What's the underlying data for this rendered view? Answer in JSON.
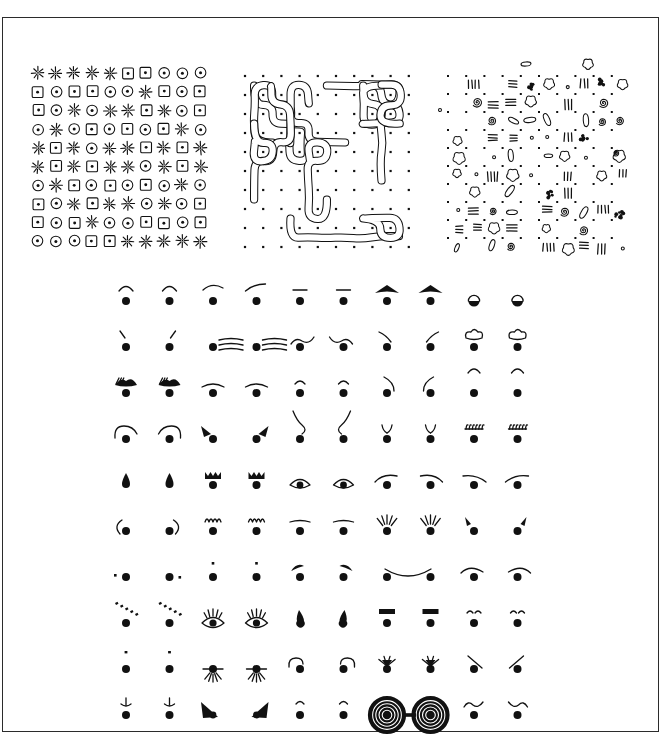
{
  "figure": {
    "title": "",
    "background_color": "#ffffff",
    "ink_color": "#111111",
    "frame": {
      "border_color": "#2b2b2b",
      "border_width_px": 1.4
    }
  },
  "top_panels": [
    {
      "name": "symbol-grid-panel",
      "description": "10 by 10 grid of three repeating hand-drawn symbols",
      "symbol_legend": {
        "S": "starburst-icon",
        "Q": "square-dot-icon",
        "C": "circle-dot-icon"
      },
      "rows": 10,
      "cols": 10,
      "cells": [
        [
          "S",
          "S",
          "S",
          "S",
          "S",
          "Q",
          "Q",
          "C",
          "C",
          "C"
        ],
        [
          "Q",
          "C",
          "Q",
          "Q",
          "C",
          "C",
          "S",
          "Q",
          "C",
          "Q"
        ],
        [
          "Q",
          "C",
          "S",
          "C",
          "S",
          "S",
          "Q",
          "S",
          "C",
          "Q"
        ],
        [
          "C",
          "S",
          "C",
          "Q",
          "C",
          "Q",
          "C",
          "Q",
          "S",
          "C"
        ],
        [
          "S",
          "Q",
          "S",
          "C",
          "S",
          "S",
          "Q",
          "S",
          "Q",
          "S"
        ],
        [
          "S",
          "Q",
          "S",
          "Q",
          "S",
          "S",
          "C",
          "S",
          "Q",
          "S"
        ],
        [
          "C",
          "S",
          "Q",
          "C",
          "Q",
          "C",
          "Q",
          "C",
          "S",
          "C"
        ],
        [
          "Q",
          "C",
          "S",
          "Q",
          "S",
          "S",
          "C",
          "S",
          "C",
          "Q"
        ],
        [
          "Q",
          "C",
          "Q",
          "S",
          "C",
          "C",
          "Q",
          "Q",
          "C",
          "Q"
        ],
        [
          "C",
          "C",
          "C",
          "Q",
          "Q",
          "S",
          "S",
          "S",
          "S",
          "S"
        ]
      ]
    },
    {
      "name": "squiggle-maze-panel",
      "description": "Continuous organic squiggle ribbons weaving around a regular dot lattice",
      "dot_rows": 10,
      "dot_cols": 10
    },
    {
      "name": "doodle-texture-panel",
      "description": "Scattered assorted hand-drawn marks on a dot lattice",
      "dot_rows": 10,
      "dot_cols": 10,
      "mark_types": [
        "cloud-blob-icon",
        "spiral-icon",
        "tally-marks-icon",
        "oval-icon",
        "scribble-blob-icon",
        "small-dot-icon"
      ]
    }
  ],
  "eye_grid": {
    "name": "eye-variations-grid",
    "description": "Ten rows by ten columns of hand-drawn eye glyphs; each glyph is a solid pupil dot with a different brow, lash or lid mark",
    "rows": 10,
    "cols": 10,
    "column_count_label": "10",
    "row_count_label": "10",
    "glyphs": [
      [
        "arc-brow-high",
        "arc-brow-high",
        "arc-brow-wide",
        "arc-brow-slant",
        "flat-bar-brow",
        "flat-bar-brow",
        "solid-triangle-brow",
        "solid-triangle-brow",
        "dome-lid",
        "dome-lid"
      ],
      [
        "short-tick-left",
        "short-tick-right",
        "triple-line-brow",
        "triple-line-brow",
        "wave-lid-left",
        "wave-lid-right",
        "angled-brow-left",
        "angled-brow-right",
        "cloud-brow",
        "cloud-brow"
      ],
      [
        "hatched-solid-brow",
        "hatched-solid-brow",
        "thin-lid-arc",
        "thin-lid-arc",
        "peak-brow-small",
        "peak-brow-small",
        "hook-brow-left",
        "hook-brow-right",
        "floating-arc",
        "floating-arc"
      ],
      [
        "curl-lid-left",
        "curl-lid-right",
        "wedge-brow-left",
        "wedge-brow-right",
        "s-curve-brow-left",
        "s-curve-brow-right",
        "antenna-brow",
        "antenna-brow",
        "comb-lash-brow",
        "comb-lash-brow"
      ],
      [
        "teardrop-pupil",
        "teardrop-pupil",
        "crown-brow",
        "crown-brow",
        "open-eye-lid",
        "open-eye-lid",
        "swoop-lid-left",
        "swoop-lid-right",
        "long-lid-left",
        "long-lid-right"
      ],
      [
        "c-lid-left",
        "c-lid-right",
        "scallop-lash-brow",
        "scallop-lash-brow",
        "flat-lid-bar",
        "flat-lid-bar",
        "ray-lash-burst",
        "ray-lash-burst",
        "tick-lash-left",
        "tick-lash-right"
      ],
      [
        "side-speck-left",
        "side-speck-right",
        "dot-above-pupil",
        "dot-above-pupil",
        "peak-lid-left",
        "peak-lid-right",
        "wide-smile-arc-left",
        "wide-smile-arc-right",
        "swoosh-lid-left",
        "swoosh-lid-right"
      ],
      [
        "dashed-slash-brow",
        "dashed-slash-brow",
        "lashed-open-eye",
        "lashed-open-eye",
        "droplet-pupil-left",
        "droplet-pupil-right",
        "block-bar-brow",
        "block-bar-brow",
        "tiny-arc-pair",
        "tiny-arc-pair"
      ],
      [
        "plain-pupil-speck",
        "plain-pupil-speck",
        "lower-lash-burst",
        "lower-lash-burst",
        "curl-over-lid-left",
        "curl-over-lid-right",
        "crow-foot-lash",
        "crow-foot-lash",
        "slash-through-left",
        "slash-through-right"
      ],
      [
        "anchor-brow",
        "anchor-brow",
        "solid-wedge-left",
        "solid-wedge-right",
        "small-peak-brow",
        "small-peak-brow",
        "spiral-spectacles-left",
        "spiral-spectacles-right",
        "wave-brow-left",
        "wave-brow-right"
      ]
    ]
  }
}
